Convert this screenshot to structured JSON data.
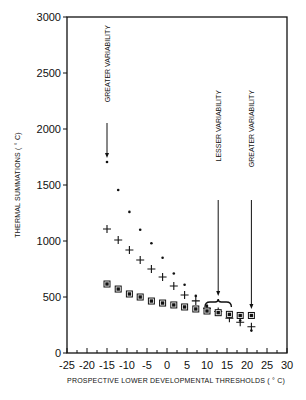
{
  "chart_data": {
    "type": "scatter",
    "title": "",
    "xlabel": "PROSPECTIVE LOWER DEVELOPMENTAL THRESHOLDS ( ° C)",
    "ylabel": "THERMAL SUMMATIONS ( ° C)",
    "xlim": [
      -25,
      30
    ],
    "ylim": [
      0,
      3000
    ],
    "xticks": [
      -25,
      -20,
      -15,
      -10,
      -5,
      0,
      5,
      10,
      15,
      20,
      25,
      30
    ],
    "yticks": [
      0,
      500,
      1000,
      1500,
      2000,
      2500,
      3000
    ],
    "grid": false,
    "legend": null,
    "x": [
      -15,
      -12.2,
      -9.4,
      -6.7,
      -3.9,
      -1.1,
      1.7,
      4.4,
      7.2,
      10,
      12.8,
      15.6,
      18.3,
      21.1
    ],
    "series": [
      {
        "name": "dot",
        "marker": "dot",
        "values": [
          1705,
          1455,
          1260,
          1100,
          980,
          850,
          710,
          610,
          510,
          420,
          380,
          350,
          290,
          200
        ]
      },
      {
        "name": "plus",
        "marker": "plus",
        "values": [
          1107,
          1009,
          920,
          830,
          750,
          679,
          598,
          518,
          465,
          400,
          370,
          310,
          275,
          235
        ]
      },
      {
        "name": "square",
        "marker": "square",
        "values": [
          616,
          571,
          527,
          500,
          464,
          446,
          429,
          411,
          393,
          375,
          360,
          345,
          335,
          335
        ]
      }
    ],
    "annotations": [
      {
        "text": "GREATER VARIABILITY",
        "x": -15,
        "arrow_to": 1705,
        "orientation": "vertical"
      },
      {
        "text": "LESSER VARIABILITY",
        "x": 12.8,
        "arrow_to": 380,
        "orientation": "vertical",
        "bracket": [
          10,
          15.6
        ]
      },
      {
        "text": "GREATER VARIABILITY",
        "x": 21.1,
        "arrow_to": 335,
        "orientation": "vertical"
      }
    ]
  }
}
